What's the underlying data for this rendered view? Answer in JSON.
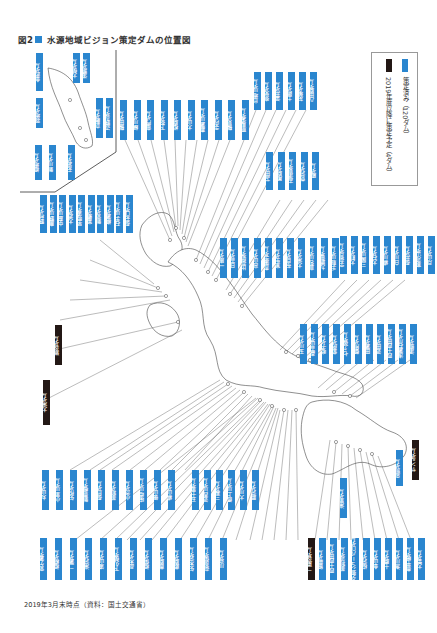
{
  "title": {
    "label": "図2",
    "text": "水源地域ビジョン策定ダムの位置図",
    "marker_color": "#2a86cf"
  },
  "legend": {
    "items": [
      {
        "label": "策定済み（120ダム）",
        "color": "#2a86cf"
      },
      {
        "label": "2019年度以降に策定予定（4ダム）",
        "color": "#231815"
      }
    ]
  },
  "footer": {
    "text": "2019年3月末時点（資料：国土交通省）"
  },
  "colors": {
    "completed": "#2a86cf",
    "planned": "#231815",
    "leader_line": "#555555",
    "map_outline": "#444444"
  },
  "labels": {
    "inset": [
      {
        "text": "金武ダム",
        "type": "completed"
      },
      {
        "text": "大保ダム",
        "type": "completed"
      },
      {
        "text": "漢那ダム",
        "type": "completed"
      },
      {
        "text": "羽地ダム",
        "type": "completed"
      },
      {
        "text": "福地ダム",
        "type": "completed"
      },
      {
        "text": "新川ダム",
        "type": "completed"
      },
      {
        "text": "安波ダム",
        "type": "completed"
      },
      {
        "text": "倉敷ダム",
        "type": "completed"
      },
      {
        "text": "辺野喜ダム",
        "type": "completed"
      }
    ],
    "top_row": [
      {
        "text": "鶴田ダム",
        "type": "completed"
      },
      {
        "text": "緑川ダム",
        "type": "completed"
      },
      {
        "text": "竜門ダム",
        "type": "completed"
      },
      {
        "text": "下筌ダム",
        "type": "completed"
      },
      {
        "text": "松原ダム",
        "type": "completed"
      },
      {
        "text": "大山ダム",
        "type": "completed"
      },
      {
        "text": "嘉瀬川ダム",
        "type": "completed"
      },
      {
        "text": "寺内ダム",
        "type": "completed"
      },
      {
        "text": "鶴見ダム",
        "type": "completed"
      },
      {
        "text": "耶馬溪ダム",
        "type": "completed"
      }
    ],
    "top_right_group": [
      {
        "text": "島地川ダム",
        "type": "completed"
      },
      {
        "text": "弥栄ダム",
        "type": "completed"
      },
      {
        "text": "温井ダム",
        "type": "completed"
      },
      {
        "text": "土師ダム",
        "type": "completed"
      },
      {
        "text": "灰塚ダム",
        "type": "completed"
      },
      {
        "text": "八田原ダム",
        "type": "completed"
      }
    ],
    "upper_middle_group": [
      {
        "text": "苫田ダム",
        "type": "completed"
      },
      {
        "text": "尾原ダム",
        "type": "completed"
      },
      {
        "text": "志津見ダム",
        "type": "completed"
      },
      {
        "text": "菅沢ダム",
        "type": "completed"
      },
      {
        "text": "殿ダム",
        "type": "completed"
      }
    ],
    "middle_row": [
      {
        "text": "一庫ダム",
        "type": "completed"
      },
      {
        "text": "日吉ダム",
        "type": "completed"
      },
      {
        "text": "比奈知ダム",
        "type": "completed"
      },
      {
        "text": "高山ダム",
        "type": "completed"
      },
      {
        "text": "青蓮寺ダム",
        "type": "completed"
      },
      {
        "text": "室生ダム",
        "type": "completed"
      },
      {
        "text": "布目ダム",
        "type": "completed"
      },
      {
        "text": "大滝ダム",
        "type": "completed"
      },
      {
        "text": "真名川ダム",
        "type": "completed"
      },
      {
        "text": "九頭竜ダム",
        "type": "completed"
      },
      {
        "text": "手取川ダム",
        "type": "completed"
      }
    ],
    "right_upper_group": [
      {
        "text": "宇奈月ダム",
        "type": "completed"
      },
      {
        "text": "大町ダム",
        "type": "completed"
      },
      {
        "text": "三国川ダム",
        "type": "completed"
      },
      {
        "text": "大石ダム",
        "type": "completed"
      },
      {
        "text": "横川ダム",
        "type": "completed"
      },
      {
        "text": "白川ダム",
        "type": "completed"
      },
      {
        "text": "長井ダム",
        "type": "completed"
      },
      {
        "text": "寒河江ダム",
        "type": "completed"
      },
      {
        "text": "月山ダム",
        "type": "completed"
      }
    ],
    "right_middle_group": [
      {
        "text": "玉川ダム",
        "type": "completed"
      },
      {
        "text": "森吉山ダム",
        "type": "completed"
      },
      {
        "text": "鳴子ダム",
        "type": "completed"
      },
      {
        "text": "釜房ダム",
        "type": "completed"
      },
      {
        "text": "七ヶ宿ダム",
        "type": "completed"
      },
      {
        "text": "御所ダム",
        "type": "completed"
      },
      {
        "text": "田瀬ダム",
        "type": "completed"
      },
      {
        "text": "湯田ダム",
        "type": "completed"
      },
      {
        "text": "四十四田ダム",
        "type": "completed"
      },
      {
        "text": "浅瀬石川ダム",
        "type": "completed"
      },
      {
        "text": "津軽ダム",
        "type": "completed"
      }
    ],
    "left_group": [
      {
        "text": "野村ダム",
        "type": "completed"
      },
      {
        "text": "鹿野川ダム",
        "type": "completed"
      },
      {
        "text": "中筋川ダム",
        "type": "completed"
      },
      {
        "text": "大渡ダム",
        "type": "completed"
      },
      {
        "text": "早明浦ダム",
        "type": "completed"
      },
      {
        "text": "富郷ダム",
        "type": "completed"
      },
      {
        "text": "新宮ダム",
        "type": "completed"
      },
      {
        "text": "柳瀬ダム",
        "type": "completed"
      },
      {
        "text": "石手川ダム",
        "type": "completed"
      },
      {
        "text": "長安口ダム",
        "type": "completed"
      }
    ],
    "left_planned": [
      {
        "text": "猿谷ダム",
        "type": "planned"
      },
      {
        "text": "大滝ダム",
        "type": "planned"
      }
    ],
    "lower_left_row": [
      {
        "text": "丸山ダム",
        "type": "completed"
      },
      {
        "text": "小里川ダム",
        "type": "completed"
      },
      {
        "text": "矢作ダム",
        "type": "completed"
      },
      {
        "text": "新豊根ダム",
        "type": "completed"
      },
      {
        "text": "長島ダム",
        "type": "completed"
      },
      {
        "text": "美和ダム",
        "type": "completed"
      },
      {
        "text": "小渋ダム",
        "type": "completed"
      },
      {
        "text": "味噌川ダム",
        "type": "completed"
      },
      {
        "text": "徳山ダム",
        "type": "completed"
      },
      {
        "text": "横山ダム",
        "type": "completed"
      }
    ],
    "lower_middle_row": [
      {
        "text": "宮ケ瀬ダム",
        "type": "completed"
      },
      {
        "text": "相模ダム",
        "type": "completed"
      },
      {
        "text": "二瀬ダム",
        "type": "completed"
      },
      {
        "text": "滝沢ダム",
        "type": "completed"
      },
      {
        "text": "浦山ダム",
        "type": "completed"
      },
      {
        "text": "下久保ダム",
        "type": "completed"
      },
      {
        "text": "品木ダム",
        "type": "completed"
      },
      {
        "text": "相俣ダム",
        "type": "completed"
      },
      {
        "text": "薗原ダム",
        "type": "completed"
      },
      {
        "text": "藤原ダム",
        "type": "completed"
      },
      {
        "text": "矢木沢ダム",
        "type": "completed"
      },
      {
        "text": "奈良俣ダム",
        "type": "completed"
      },
      {
        "text": "川治ダム",
        "type": "completed"
      }
    ],
    "lower_right_row": [
      {
        "text": "五十里ダム",
        "type": "completed"
      },
      {
        "text": "湯西川ダム",
        "type": "completed"
      },
      {
        "text": "三春ダム",
        "type": "completed"
      },
      {
        "text": "摺上川ダム",
        "type": "completed"
      },
      {
        "text": "大川ダム",
        "type": "completed"
      },
      {
        "text": "胆沢ダム",
        "type": "completed"
      }
    ],
    "hokkaido_row": [
      {
        "text": "二風谷ダム",
        "type": "planned"
      },
      {
        "text": "留萌ダム",
        "type": "completed"
      },
      {
        "text": "四十四田ダム",
        "type": "completed"
      },
      {
        "text": "美利河ダム",
        "type": "completed"
      },
      {
        "text": "夕張シューパロダム",
        "type": "completed"
      },
      {
        "text": "桂沢ダム",
        "type": "completed"
      },
      {
        "text": "金山ダム",
        "type": "completed"
      },
      {
        "text": "十勝ダム",
        "type": "completed"
      },
      {
        "text": "漁川ダム",
        "type": "completed"
      },
      {
        "text": "豊平峡ダム",
        "type": "completed"
      },
      {
        "text": "大雪ダム",
        "type": "completed"
      }
    ],
    "hokkaido_side": [
      {
        "text": "サンルダム",
        "type": "planned"
      },
      {
        "text": "忠別ダム",
        "type": "completed"
      },
      {
        "text": "滝里ダム",
        "type": "completed"
      }
    ]
  }
}
